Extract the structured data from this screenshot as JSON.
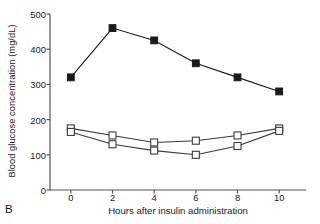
{
  "figure": {
    "panel_label": "B"
  },
  "chart_data": {
    "type": "line",
    "title": "",
    "xlabel": "Hours after insulin administration",
    "ylabel": "Blood glucose concentration (mg/dL)",
    "x": [
      0,
      2,
      4,
      6,
      8,
      10
    ],
    "xlim": [
      -1,
      11
    ],
    "ylim": [
      0,
      500
    ],
    "xticks": [
      0,
      2,
      4,
      6,
      8,
      10
    ],
    "xticklabels": [
      "0",
      "2",
      "4",
      "6",
      "8",
      "10"
    ],
    "yticks": [
      0,
      100,
      200,
      300,
      400,
      500
    ],
    "yticklabels": [
      "0",
      "100",
      "200",
      "300",
      "400",
      "500"
    ],
    "grid": false,
    "legend": "none",
    "series": [
      {
        "name": "filled-square-series",
        "marker": "filled-square",
        "color": "#1a1a1a",
        "values": [
          320,
          460,
          425,
          360,
          320,
          280
        ]
      },
      {
        "name": "open-square-series-1",
        "marker": "open-square",
        "color": "#3a3a3a",
        "values": [
          175,
          155,
          135,
          140,
          155,
          175
        ]
      },
      {
        "name": "open-square-series-2",
        "marker": "open-square",
        "color": "#3a3a3a",
        "values": [
          165,
          130,
          112,
          100,
          125,
          168
        ]
      }
    ],
    "axis_color": "#555555",
    "plot_area": {
      "left": 50,
      "right": 300,
      "top": 14,
      "bottom": 190
    }
  }
}
